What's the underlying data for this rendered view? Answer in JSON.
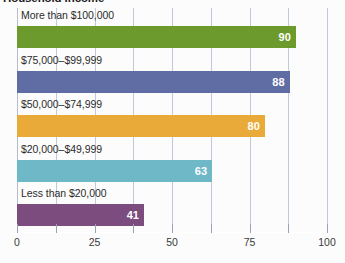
{
  "chart_data": {
    "type": "bar",
    "orientation": "horizontal",
    "title": "Household Income",
    "xlabel": "",
    "ylabel": "",
    "xlim": [
      0,
      100
    ],
    "grid": true,
    "legend": "none",
    "categories": [
      "More than $100,000",
      "$75,000–$99,999",
      "$50,000–$74,999",
      "$20,000–$49,999",
      "Less than $20,000"
    ],
    "values": [
      90,
      88,
      80,
      63,
      41
    ],
    "colors": [
      "#6c9a2c",
      "#606da4",
      "#e9aa39",
      "#6fb8c8",
      "#7c4c7f"
    ],
    "tick_values": [
      0,
      12.5,
      25,
      37.5,
      50,
      62.5,
      75,
      87.5,
      100
    ],
    "tick_labels": [
      "0",
      "",
      "25",
      "",
      "50",
      "",
      "75",
      "",
      "100"
    ],
    "gridline_color": "#c2cada",
    "background_color": "#fcfcfc",
    "value_label_color": "#ffffff"
  }
}
